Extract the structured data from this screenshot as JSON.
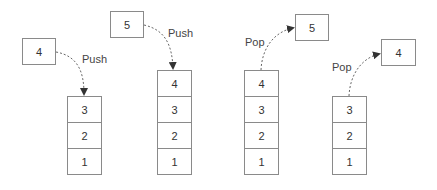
{
  "diagram": {
    "colors": {
      "stroke": "#8a8a8a",
      "text": "#333333",
      "arrow": "#555555"
    },
    "steps": [
      {
        "operation": "Push",
        "incoming_item": "4",
        "stack": [
          "3",
          "2",
          "1"
        ]
      },
      {
        "operation": "Push",
        "incoming_item": "5",
        "stack": [
          "4",
          "3",
          "2",
          "1"
        ]
      },
      {
        "operation": "Pop",
        "outgoing_item": "5",
        "stack": [
          "4",
          "3",
          "2",
          "1"
        ]
      },
      {
        "operation": "Pop",
        "outgoing_item": "4",
        "stack": [
          "3",
          "2",
          "1"
        ]
      }
    ]
  }
}
